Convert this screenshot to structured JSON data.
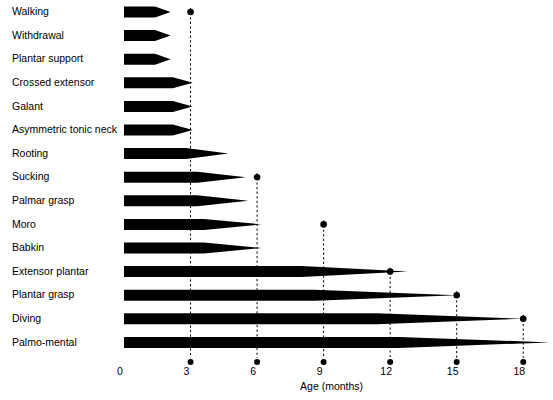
{
  "chart_data": {
    "type": "bar",
    "title": "",
    "subtitle": "",
    "xlabel": "Age (months)",
    "ylabel": "",
    "xlim": [
      0,
      19.5
    ],
    "xticks": [
      0,
      3,
      6,
      9,
      12,
      15,
      18
    ],
    "xticklabels": [
      "0",
      "3",
      "6",
      "9",
      "12",
      "15",
      "18"
    ],
    "grid": "vertical dashed guide lines at 3, 6, 9, 12, 15, 18",
    "legend": "none",
    "orientation": "horizontal",
    "note": "Each bar starts at age 0 and tapers to a point at the age when the primitive reflex disappears; the dot marks the outer age limit of its disappearance group.",
    "categories": [
      "Walking",
      "Withdrawal",
      "Plantar support",
      "Crossed extensor",
      "Galant",
      "Asymmetric tonic neck",
      "Rooting",
      "Sucking",
      "Palmar grasp",
      "Moro",
      "Babkin",
      "Extensor plantar",
      "Plantar grasp",
      "Diving",
      "Palmo-mental"
    ],
    "bars": [
      {
        "label": "Walking",
        "start": 0,
        "solid_end": 1.4,
        "tip_end": 2.1,
        "group_dot": 3
      },
      {
        "label": "Withdrawal",
        "start": 0,
        "solid_end": 1.4,
        "tip_end": 2.1,
        "group_dot": 3
      },
      {
        "label": "Plantar support",
        "start": 0,
        "solid_end": 1.4,
        "tip_end": 2.1,
        "group_dot": 3
      },
      {
        "label": "Crossed extensor",
        "start": 0,
        "solid_end": 2.2,
        "tip_end": 3.1,
        "group_dot": 3
      },
      {
        "label": "Galant",
        "start": 0,
        "solid_end": 2.2,
        "tip_end": 3.1,
        "group_dot": 3
      },
      {
        "label": "Asymmetric tonic neck",
        "start": 0,
        "solid_end": 2.2,
        "tip_end": 3.1,
        "group_dot": 3
      },
      {
        "label": "Rooting",
        "start": 0,
        "solid_end": 2.8,
        "tip_end": 4.7,
        "group_dot": 3
      },
      {
        "label": "Sucking",
        "start": 0,
        "solid_end": 3.3,
        "tip_end": 5.5,
        "group_dot": 6
      },
      {
        "label": "Palmar grasp",
        "start": 0,
        "solid_end": 3.3,
        "tip_end": 5.6,
        "group_dot": 6
      },
      {
        "label": "Moro",
        "start": 0,
        "solid_end": 3.6,
        "tip_end": 6.2,
        "group_dot": 9
      },
      {
        "label": "Babkin",
        "start": 0,
        "solid_end": 3.6,
        "tip_end": 6.2,
        "group_dot": 6
      },
      {
        "label": "Extensor plantar",
        "start": 0,
        "solid_end": 8.0,
        "tip_end": 12.8,
        "group_dot": 12
      },
      {
        "label": "Plantar grasp",
        "start": 0,
        "solid_end": 8.6,
        "tip_end": 15.0,
        "group_dot": 15
      },
      {
        "label": "Diving",
        "start": 0,
        "solid_end": 11.4,
        "tip_end": 18.0,
        "group_dot": 18
      },
      {
        "label": "Palmo-mental",
        "start": 0,
        "solid_end": 12.4,
        "tip_end": 19.2,
        "group_dot": 18
      }
    ],
    "group_dot_ages": [
      3,
      6,
      9,
      12,
      15,
      18
    ],
    "colors": {
      "bar": "#000000",
      "dot": "#000000",
      "guide_line": "#000000",
      "background": "#ffffff",
      "text": "#000000"
    }
  },
  "axis": {
    "x_title": "Age (months)"
  }
}
